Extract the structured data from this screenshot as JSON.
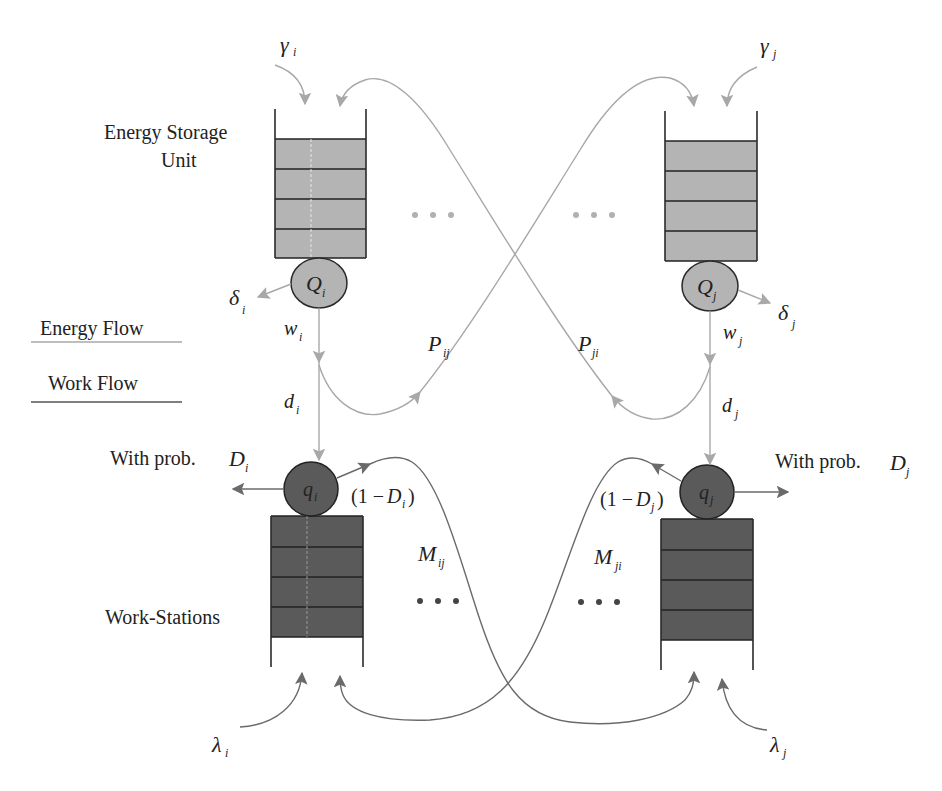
{
  "diagram": {
    "legend": {
      "energy_flow": "Energy Flow",
      "work_flow": "Work Flow"
    },
    "labels": {
      "energy_storage_line1": "Energy Storage",
      "energy_storage_line2": "Unit",
      "work_stations": "Work-Stations",
      "with_prob": "With prob.",
      "ellipsis": "···"
    },
    "node_i": {
      "gamma": "γ",
      "gamma_sub": "i",
      "Q": "Q",
      "Q_sub": "i",
      "delta": "δ",
      "delta_sub": "i",
      "w": "w",
      "w_sub": "i",
      "d": "d",
      "d_sub": "i",
      "q": "q",
      "q_sub": "i",
      "D": "D",
      "D_sub": "i",
      "one_minus_open": "(1 − ",
      "one_minus_D": "D",
      "one_minus_sub": "i",
      "one_minus_close": ")",
      "lambda": "λ",
      "lambda_sub": "i",
      "P": "P",
      "P_sub": "ij",
      "M": "M",
      "M_sub": "ij"
    },
    "node_j": {
      "gamma": "γ",
      "gamma_sub": "j",
      "Q": "Q",
      "Q_sub": "j",
      "delta": "δ",
      "delta_sub": "j",
      "w": "w",
      "w_sub": "j",
      "d": "d",
      "d_sub": "j",
      "q": "q",
      "q_sub": "j",
      "D": "D",
      "D_sub": "j",
      "one_minus_open": "(1 − ",
      "one_minus_D": "D",
      "one_minus_sub": "j",
      "one_minus_close": ")",
      "lambda": "λ",
      "lambda_sub": "j",
      "P": "P",
      "P_sub": "ji",
      "M": "M",
      "M_sub": "ji"
    },
    "colors": {
      "energy_fill": "#b4b4b4",
      "work_fill": "#5a5a5a",
      "energy_arrow": "#a8a8a8",
      "work_arrow": "#6a6a6a"
    }
  }
}
